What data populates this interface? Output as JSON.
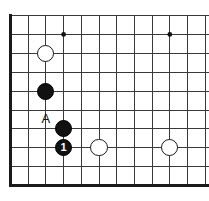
{
  "diagram": {
    "type": "go-board-diagram",
    "game": "Go",
    "board": {
      "columns": 12,
      "rows": 10,
      "origin_x": 10.5,
      "origin_y": 15.5,
      "cell_width": 17.7,
      "cell_height": 18.9,
      "line_color": "#3a3a3a",
      "line_width": 1,
      "edge_color": "#1a1a1a",
      "edge_width": 3,
      "background_color": "#ffffff",
      "edges": {
        "left": true,
        "bottom": true,
        "top": false,
        "right": false
      }
    },
    "star_points": [
      {
        "col": 3,
        "row": 1,
        "label": "upper-left-star"
      },
      {
        "col": 9,
        "row": 1,
        "label": "upper-right-star"
      },
      {
        "col": 9,
        "row": 7,
        "label": "lower-right-star"
      }
    ],
    "star_point_radius": 2.4,
    "stone_radius": 8.6,
    "stones": [
      {
        "id": "white-1",
        "color": "white",
        "col": 2,
        "row": 2,
        "label": ""
      },
      {
        "id": "black-1",
        "color": "black",
        "col": 2,
        "row": 4,
        "label": ""
      },
      {
        "id": "black-2",
        "color": "black",
        "col": 3,
        "row": 6,
        "label": ""
      },
      {
        "id": "black-3",
        "color": "black",
        "col": 3,
        "row": 7,
        "label": "1"
      },
      {
        "id": "white-2",
        "color": "white",
        "col": 5,
        "row": 7,
        "label": ""
      },
      {
        "id": "white-3",
        "color": "white",
        "col": 9,
        "row": 7,
        "label": ""
      }
    ],
    "markers": [
      {
        "id": "marker-a",
        "text": "A",
        "col": 2,
        "row": 5.5,
        "font_size": 13
      }
    ]
  }
}
